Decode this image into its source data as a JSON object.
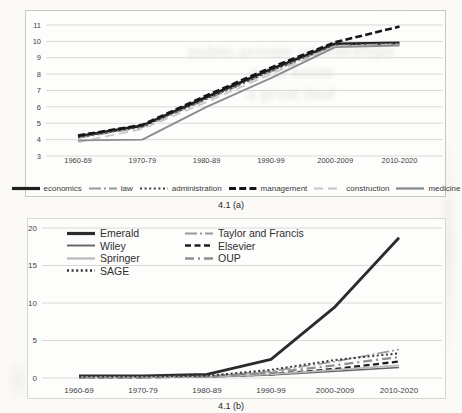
{
  "captions": {
    "chart_a": "4.1 (a)",
    "chart_b": "4.1 (b)"
  },
  "bleed_through": {
    "lines": [
      "public-private partnerships",
      "must know",
      "a great deal"
    ]
  },
  "colors": {
    "gridline": "#d9d9d7",
    "tick_text": "#3e3e3e",
    "paper": "#fbfaf6"
  },
  "chart_data": [
    {
      "id": "chart_a",
      "type": "line",
      "title": "",
      "caption": "4.1 (a)",
      "categories": [
        "1960-69",
        "1970-79",
        "1980-89",
        "1990-99",
        "2000-2009",
        "2010-2020"
      ],
      "xlabel": "",
      "ylabel": "",
      "ylim": [
        3,
        11
      ],
      "y_ticks": [
        3,
        4,
        5,
        6,
        7,
        8,
        9,
        10,
        11
      ],
      "grid": true,
      "legend_position": "bottom",
      "series": [
        {
          "name": "economics",
          "values": [
            4.2,
            4.85,
            6.6,
            8.3,
            9.85,
            9.9
          ],
          "color": "#1f1f1f",
          "dash": "",
          "width": 2.8
        },
        {
          "name": "law",
          "values": [
            4.1,
            4.75,
            6.45,
            8.15,
            9.75,
            9.85
          ],
          "color": "#9a9a9a",
          "dash": "12 3 2 3",
          "width": 1.7
        },
        {
          "name": "administration",
          "values": [
            4.15,
            4.8,
            6.5,
            8.2,
            9.8,
            9.9
          ],
          "color": "#3c3c3c",
          "dash": "2 2.6",
          "width": 1.7
        },
        {
          "name": "management",
          "values": [
            4.25,
            4.9,
            6.7,
            8.4,
            9.95,
            10.9
          ],
          "color": "#161616",
          "dash": "7 3.2",
          "width": 2.6
        },
        {
          "name": "construction",
          "values": [
            3.85,
            4.65,
            6.3,
            8.0,
            9.7,
            9.8
          ],
          "color": "#c6c6c6",
          "dash": "9 5",
          "width": 1.7
        },
        {
          "name": "medicine",
          "values": [
            3.95,
            4.0,
            6.0,
            7.75,
            9.65,
            9.75
          ],
          "color": "#8d8d8d",
          "dash": "",
          "width": 1.9
        }
      ]
    },
    {
      "id": "chart_b",
      "type": "line",
      "title": "",
      "caption": "4.1 (b)",
      "categories": [
        "1960-69",
        "1970-79",
        "1980-89",
        "1990-99",
        "2000-2009",
        "2010-2020"
      ],
      "xlabel": "",
      "ylabel": "",
      "ylim": [
        0,
        20
      ],
      "y_ticks": [
        0,
        5,
        10,
        15,
        20
      ],
      "grid": true,
      "legend_position": "inside-top-left",
      "series": [
        {
          "name": "Emerald",
          "values": [
            0.3,
            0.3,
            0.5,
            2.5,
            9.5,
            18.7
          ],
          "color": "#2b2b2b",
          "dash": "",
          "width": 2.8
        },
        {
          "name": "Taylor and Francis",
          "values": [
            0.1,
            0.1,
            0.2,
            0.9,
            2.2,
            3.8
          ],
          "color": "#9a9a9a",
          "dash": "12 3 2 3",
          "width": 1.7
        },
        {
          "name": "Wiley",
          "values": [
            0.1,
            0.1,
            0.15,
            0.4,
            0.9,
            1.4
          ],
          "color": "#636363",
          "dash": "",
          "width": 1.5
        },
        {
          "name": "Elsevier",
          "values": [
            0.1,
            0.1,
            0.2,
            0.5,
            1.2,
            2.2
          ],
          "color": "#1d1d1d",
          "dash": "6 3.5",
          "width": 2.3
        },
        {
          "name": "Springer",
          "values": [
            0.1,
            0.1,
            0.15,
            0.5,
            1.1,
            1.7
          ],
          "color": "#b9b9b9",
          "dash": "",
          "width": 1.8
        },
        {
          "name": "OUP",
          "values": [
            0.1,
            0.1,
            0.2,
            0.7,
            1.7,
            2.8
          ],
          "color": "#8f8f8f",
          "dash": "9 4 2 4",
          "width": 2.3
        },
        {
          "name": "SAGE",
          "values": [
            0.2,
            0.2,
            0.3,
            1.1,
            2.4,
            3.3
          ],
          "color": "#353535",
          "dash": "2 2.6",
          "width": 1.9
        }
      ]
    }
  ]
}
